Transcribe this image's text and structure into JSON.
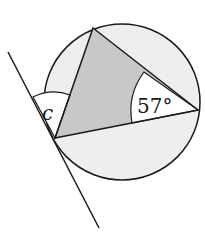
{
  "diagram": {
    "angle_label_c": "c",
    "angle_label_known": "57°",
    "colors": {
      "circle_fill": "#eeeeee",
      "triangle_fill": "#c8c8c8",
      "line": "#1a1a1a",
      "angle_fill": "#ffffff"
    }
  }
}
